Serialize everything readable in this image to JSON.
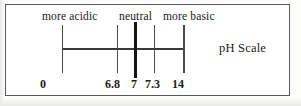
{
  "figure": {
    "title": "pH Scale",
    "top_labels": [
      {
        "id": "more-acidic",
        "text": "more acidic"
      },
      {
        "id": "neutral",
        "text": "neutral"
      },
      {
        "id": "more-basic",
        "text": "more basic"
      }
    ]
  },
  "chart_data": {
    "type": "line",
    "title": "pH Scale",
    "xlabel": "",
    "ylabel": "",
    "xlim": [
      0,
      14
    ],
    "grid": false,
    "legend": null,
    "orientation": "horizontal-number-line",
    "tick_values": [
      0,
      6.8,
      7,
      7.3,
      14
    ],
    "tick_labels": [
      "0",
      "6.8",
      "7",
      "7.3",
      "14"
    ],
    "emphasized_tick": "7",
    "annotations": [
      {
        "text": "more acidic",
        "range": [
          0,
          6.8
        ],
        "position": "above-axis"
      },
      {
        "text": "neutral",
        "range": [
          6.8,
          7.3
        ],
        "position": "above-axis"
      },
      {
        "text": "more basic",
        "range": [
          7.3,
          14
        ],
        "position": "above-axis"
      }
    ],
    "colors": {
      "axis": "#3a3a3a",
      "tick": "#4a4a4a",
      "major_tick": "#141414",
      "text": "#21201f",
      "frame": "#5a5a5a",
      "background": "#ffffff"
    }
  },
  "ticks": [
    {
      "id": "0",
      "label": "0"
    },
    {
      "id": "68",
      "label": "6.8"
    },
    {
      "id": "7",
      "label": "7"
    },
    {
      "id": "73",
      "label": "7.3"
    },
    {
      "id": "14",
      "label": "14"
    }
  ]
}
